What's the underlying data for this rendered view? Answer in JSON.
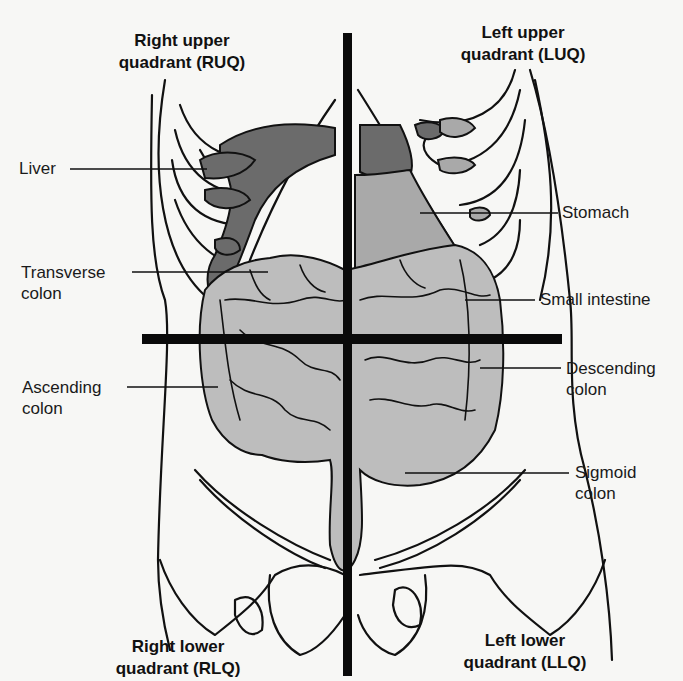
{
  "diagram": {
    "quadrants": {
      "ruq": {
        "line1": "Right upper",
        "line2": "quadrant (RUQ)"
      },
      "luq": {
        "line1": "Left upper",
        "line2": "quadrant (LUQ)"
      },
      "rlq": {
        "line1": "Right lower",
        "line2": "quadrant (RLQ)"
      },
      "llq": {
        "line1": "Left lower",
        "line2": "quadrant (LLQ)"
      }
    },
    "labels": {
      "liver": {
        "line1": "Liver"
      },
      "transverse_colon": {
        "line1": "Transverse",
        "line2": "colon"
      },
      "ascending_colon": {
        "line1": "Ascending",
        "line2": "colon"
      },
      "stomach": {
        "line1": "Stomach"
      },
      "small_intestine": {
        "line1": "Small intestine"
      },
      "descending_colon": {
        "line1": "Descending",
        "line2": "colon"
      },
      "sigmoid_colon": {
        "line1": "Sigmoid",
        "line2": "colon"
      }
    },
    "colors": {
      "background": "#f7f7f5",
      "outline": "#111111",
      "liver": "#6b6b6b",
      "stomach": "#a9a9a9",
      "intestine": "#bdbdbd",
      "axis_lines": "#0a0a0a"
    }
  }
}
